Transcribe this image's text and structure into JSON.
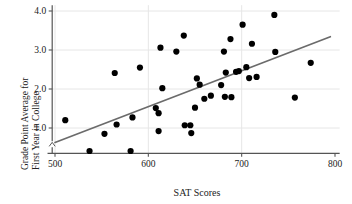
{
  "chart_data": {
    "type": "scatter",
    "title": "",
    "xlabel": "SAT Scores",
    "ylabel_line1": "Grade Point Average for",
    "ylabel_line2": "First Year in College",
    "xlim": [
      490,
      805
    ],
    "ylim": [
      0.35,
      4.15
    ],
    "xticks": [
      500,
      600,
      700,
      800
    ],
    "xtick_labels": [
      "500",
      "600",
      "700",
      "800"
    ],
    "yticks": [
      1.0,
      2.0,
      3.0,
      4.0
    ],
    "ytick_labels": [
      "1.0",
      "2.0",
      "3.0",
      "4.0"
    ],
    "grid": true,
    "grid_color": "#e6e6e6",
    "axis_break": true,
    "legend": "none",
    "marker_color": "#000000",
    "marker_size": 3.1,
    "trendline": {
      "visible": true,
      "color": "#6b6b6b",
      "width": 1.7,
      "x_start": 500,
      "y_start": 0.63,
      "x_end": 795,
      "y_end": 3.34
    },
    "points": [
      {
        "x": 511,
        "y": 1.2
      },
      {
        "x": 537,
        "y": 0.41
      },
      {
        "x": 553,
        "y": 0.85
      },
      {
        "x": 564,
        "y": 2.41
      },
      {
        "x": 566,
        "y": 1.09
      },
      {
        "x": 581,
        "y": 0.41
      },
      {
        "x": 583,
        "y": 1.27
      },
      {
        "x": 591,
        "y": 2.55
      },
      {
        "x": 608,
        "y": 1.51
      },
      {
        "x": 611,
        "y": 1.38
      },
      {
        "x": 611,
        "y": 0.92
      },
      {
        "x": 613,
        "y": 3.06
      },
      {
        "x": 615,
        "y": 2.02
      },
      {
        "x": 630,
        "y": 2.96
      },
      {
        "x": 638,
        "y": 3.37
      },
      {
        "x": 639,
        "y": 1.07
      },
      {
        "x": 645,
        "y": 1.07
      },
      {
        "x": 646,
        "y": 0.87
      },
      {
        "x": 650,
        "y": 1.52
      },
      {
        "x": 652,
        "y": 2.27
      },
      {
        "x": 655,
        "y": 2.11
      },
      {
        "x": 660,
        "y": 1.75
      },
      {
        "x": 667,
        "y": 1.83
      },
      {
        "x": 678,
        "y": 2.1
      },
      {
        "x": 681,
        "y": 2.96
      },
      {
        "x": 682,
        "y": 1.8
      },
      {
        "x": 683,
        "y": 2.42
      },
      {
        "x": 688,
        "y": 3.28
      },
      {
        "x": 689,
        "y": 1.79
      },
      {
        "x": 694,
        "y": 2.44
      },
      {
        "x": 697,
        "y": 2.46
      },
      {
        "x": 701,
        "y": 3.65
      },
      {
        "x": 705,
        "y": 2.56
      },
      {
        "x": 708,
        "y": 2.28
      },
      {
        "x": 711,
        "y": 3.16
      },
      {
        "x": 716,
        "y": 2.31
      },
      {
        "x": 735,
        "y": 3.9
      },
      {
        "x": 736,
        "y": 2.95
      },
      {
        "x": 757,
        "y": 1.78
      },
      {
        "x": 774,
        "y": 2.67
      }
    ]
  }
}
